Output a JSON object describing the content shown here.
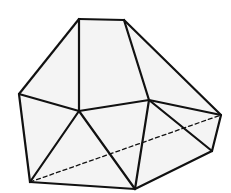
{
  "diagram": {
    "type": "polyhedron-line-drawing",
    "stroke_color": "#111111",
    "fill_color": "#f4f4f4",
    "background": "#ffffff",
    "vertices": {
      "A": [
        79,
        19
      ],
      "B": [
        124,
        20
      ],
      "C": [
        19,
        94
      ],
      "D": [
        79,
        111
      ],
      "E": [
        149,
        100
      ],
      "F": [
        221,
        115
      ],
      "G": [
        212,
        151
      ],
      "H": [
        30,
        182
      ],
      "I": [
        135,
        189
      ]
    },
    "faces": [
      [
        "A",
        "B",
        "E",
        "D"
      ],
      [
        "A",
        "D",
        "C"
      ],
      [
        "B",
        "F",
        "E"
      ],
      [
        "C",
        "D",
        "H"
      ],
      [
        "D",
        "I",
        "H"
      ],
      [
        "D",
        "E",
        "I"
      ],
      [
        "E",
        "G",
        "I"
      ],
      [
        "E",
        "F",
        "G"
      ]
    ],
    "solid_edges": [
      [
        "A",
        "B"
      ],
      [
        "A",
        "C"
      ],
      [
        "A",
        "D"
      ],
      [
        "B",
        "E"
      ],
      [
        "B",
        "F"
      ],
      [
        "C",
        "D"
      ],
      [
        "D",
        "E"
      ],
      [
        "E",
        "F"
      ],
      [
        "C",
        "H"
      ],
      [
        "D",
        "H"
      ],
      [
        "D",
        "I"
      ],
      [
        "E",
        "I"
      ],
      [
        "E",
        "G"
      ],
      [
        "F",
        "G"
      ],
      [
        "G",
        "I"
      ],
      [
        "H",
        "I"
      ]
    ],
    "hidden_edges": [
      [
        "H",
        "F"
      ]
    ]
  }
}
